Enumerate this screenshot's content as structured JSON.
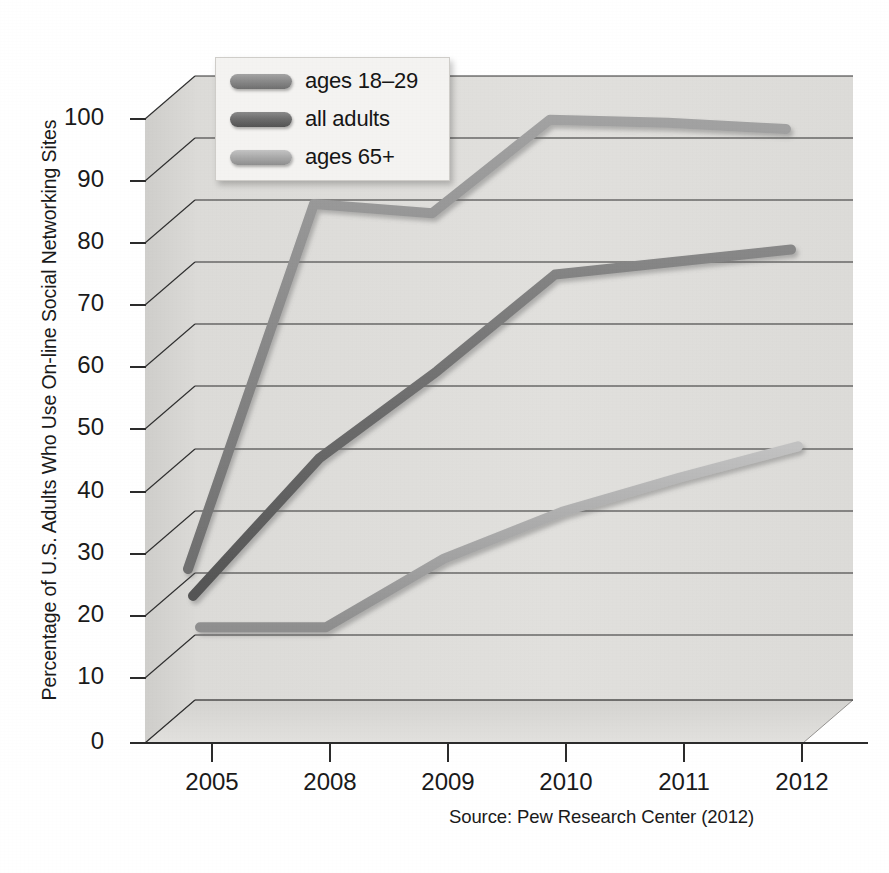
{
  "chart_data": {
    "type": "line",
    "title": "",
    "xlabel": "",
    "ylabel": "Percentage of U.S. Adults Who Use On-line Social Networking Sites",
    "categories": [
      "2005",
      "2008",
      "2009",
      "2010",
      "2011",
      "2012"
    ],
    "xticklabels": [
      "2005",
      "2008",
      "2009",
      "2010",
      "2011",
      "2012"
    ],
    "yticklabels": [
      "0",
      "10",
      "20",
      "30",
      "40",
      "50",
      "60",
      "70",
      "80",
      "90",
      "100"
    ],
    "ytickvalues": [
      0,
      10,
      20,
      30,
      40,
      50,
      60,
      70,
      80,
      90,
      100
    ],
    "ylim": [
      0,
      100
    ],
    "grid": "horizontal",
    "legend_position": "top-left-inside",
    "three_d": true,
    "series": [
      {
        "name": "ages 18-29",
        "label": "ages 18–29",
        "color": "#8b8b8b",
        "values": [
          21,
          79.5,
          78,
          93,
          92.5,
          91.5
        ]
      },
      {
        "name": "all adults",
        "label": "all adults",
        "color": "#6d6d6d",
        "values": [
          16,
          38,
          52,
          67.5,
          69.5,
          71.5
        ]
      },
      {
        "name": "ages 65+",
        "label": "ages 65+",
        "color": "#ababab",
        "values": [
          10,
          10,
          21,
          28.5,
          34,
          39
        ]
      }
    ],
    "annotations": [
      "Source: Pew Research Center (2012)"
    ]
  },
  "axes": {
    "y_title": "Percentage of U.S. Adults Who Use On-line Social Networking Sites",
    "y_ticks": [
      "100",
      "90",
      "80",
      "70",
      "60",
      "50",
      "40",
      "30",
      "20",
      "10",
      "0"
    ],
    "x_ticks": [
      "2005",
      "2008",
      "2009",
      "2010",
      "2011",
      "2012"
    ]
  },
  "legend": {
    "items": [
      {
        "label": "ages 18–29",
        "color": "#8b8b8b"
      },
      {
        "label": "all adults",
        "color": "#6d6d6d"
      },
      {
        "label": "ages 65+",
        "color": "#ababab"
      }
    ]
  },
  "source": {
    "text": "Source: Pew Research Center (2012)"
  },
  "colors": {
    "plot_floor": "#dedddb",
    "plot_wall": "#d2d1cf",
    "gridline": "#2f2f2f",
    "axis_line": "#2b2b2b",
    "legend_bg": "#f4f3f1",
    "series_young": "#8b8b8b",
    "series_all": "#6d6d6d",
    "series_old": "#ababab",
    "text": "#1a1a1a"
  }
}
